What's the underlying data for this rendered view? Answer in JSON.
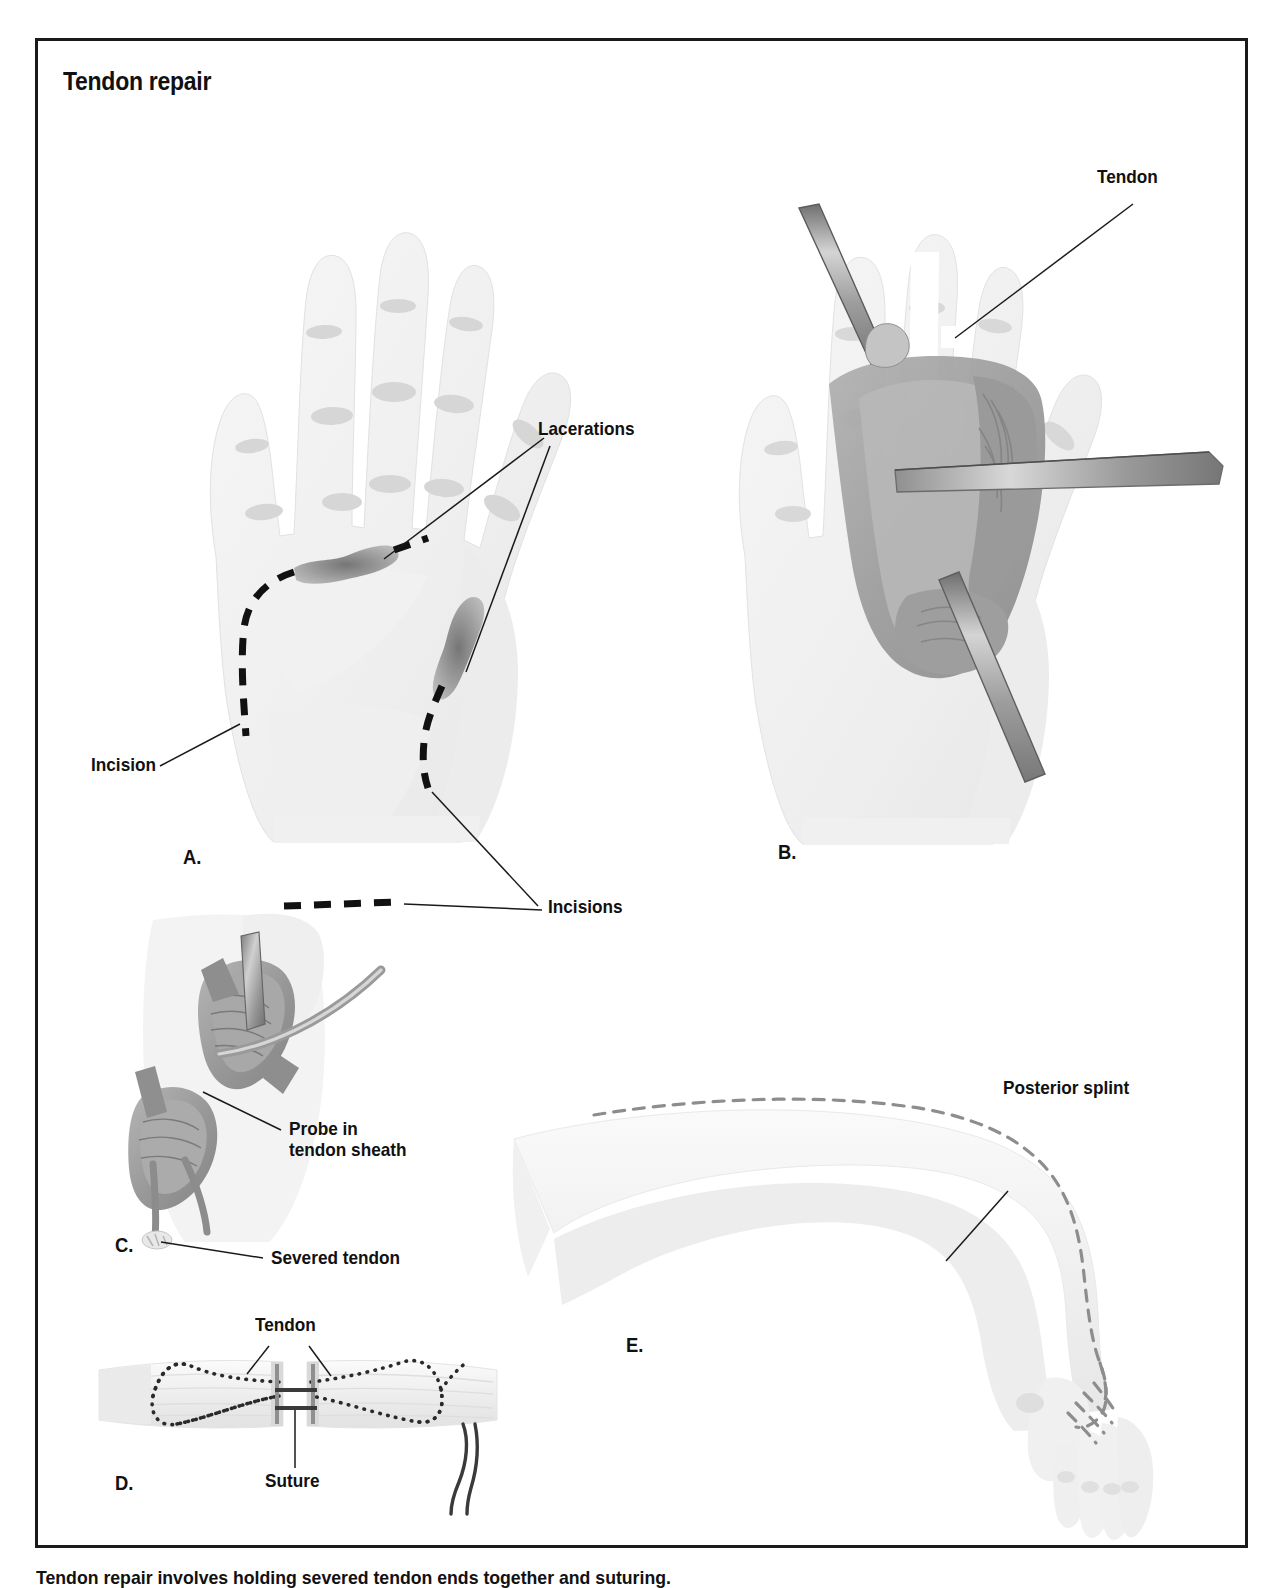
{
  "figure": {
    "title": "Tendon repair",
    "caption": "Tendon repair involves holding severed tendon ends together and suturing."
  },
  "panels": [
    {
      "id": "A",
      "letter": "A.",
      "description": "Palmar view of hand showing lacerations and planned surgical incisions",
      "annotations": [
        {
          "name": "lacerations",
          "label": "Lacerations"
        },
        {
          "name": "incision",
          "label": "Incision"
        },
        {
          "name": "incisions",
          "label": "Incisions"
        }
      ]
    },
    {
      "id": "B",
      "letter": "B.",
      "description": "Open surgical field of palm with retractors exposing the tendon",
      "annotations": [
        {
          "name": "tendon",
          "label": "Tendon"
        }
      ]
    },
    {
      "id": "C",
      "letter": "C.",
      "description": "Close-up of finger with probe in tendon sheath and severed tendon",
      "annotations": [
        {
          "name": "probe-in-tendon-sheath",
          "label": "Probe in\ntendon sheath"
        },
        {
          "name": "severed-tendon",
          "label": "Severed tendon"
        }
      ]
    },
    {
      "id": "D",
      "letter": "D.",
      "description": "Detail of sutured tendon ends with zigzag suture pattern",
      "annotations": [
        {
          "name": "tendon",
          "label": "Tendon"
        },
        {
          "name": "suture",
          "label": "Suture"
        }
      ]
    },
    {
      "id": "E",
      "letter": "E.",
      "description": "Lateral view of forearm and hand in posterior splint",
      "annotations": [
        {
          "name": "posterior-splint",
          "label": "Posterior splint"
        }
      ]
    }
  ],
  "colors": {
    "frame_border": "#1a1a1a",
    "text": "#111111",
    "skin_light": "#f1f1f1",
    "skin_shadow": "#d9d9d9",
    "tissue_mid": "#a3a3a3",
    "tissue_dark": "#8a8a8a",
    "instrument": "#9b9b9b",
    "incision_black": "#111111",
    "laceration_gray": "#8f8f8f",
    "splint_dash": "#8d8d8d"
  }
}
